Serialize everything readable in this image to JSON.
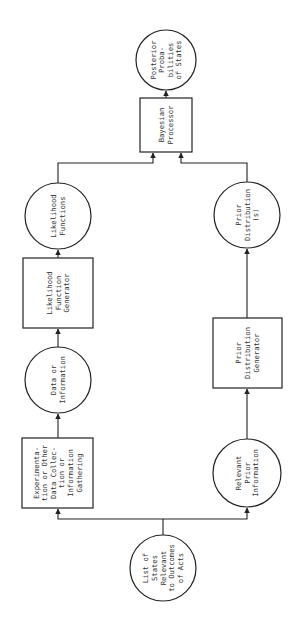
{
  "diagram": {
    "orientation": "rotated-90-ccw",
    "nodes": [
      {
        "id": "list_states",
        "shape": "circle",
        "lines": [
          "List of",
          "States",
          "Relevant",
          "to Outcomes",
          "of Acts"
        ]
      },
      {
        "id": "experimentation",
        "shape": "box",
        "lines": [
          "Experimenta-",
          "tion or Other",
          "Data Collec-",
          "tion or",
          "Information",
          "Gathering"
        ]
      },
      {
        "id": "data_info",
        "shape": "circle",
        "lines": [
          "Data or",
          "Information"
        ]
      },
      {
        "id": "likelihood_gen",
        "shape": "box",
        "lines": [
          "Likelihood",
          "Function",
          "Generator"
        ]
      },
      {
        "id": "likelihood_funcs",
        "shape": "circle",
        "lines": [
          "Likelihood",
          "Functions"
        ]
      },
      {
        "id": "relevant_prior",
        "shape": "circle",
        "lines": [
          "Relevant",
          "Prior",
          "Information"
        ]
      },
      {
        "id": "prior_gen",
        "shape": "box",
        "lines": [
          "Prior",
          "Distribution",
          "Generator"
        ]
      },
      {
        "id": "prior_dist",
        "shape": "circle",
        "lines": [
          "Prior",
          "Distribution",
          "(s)"
        ]
      },
      {
        "id": "bayesian",
        "shape": "box",
        "lines": [
          "Bayesian",
          "Processor"
        ]
      },
      {
        "id": "posterior",
        "shape": "circle",
        "lines": [
          "Posterior",
          "Proba-",
          "bilities",
          "of States"
        ]
      }
    ],
    "edges": [
      {
        "from": "list_states",
        "to": "experimentation"
      },
      {
        "from": "list_states",
        "to": "relevant_prior"
      },
      {
        "from": "experimentation",
        "to": "data_info"
      },
      {
        "from": "data_info",
        "to": "likelihood_gen"
      },
      {
        "from": "likelihood_gen",
        "to": "likelihood_funcs"
      },
      {
        "from": "likelihood_funcs",
        "to": "bayesian"
      },
      {
        "from": "relevant_prior",
        "to": "prior_gen"
      },
      {
        "from": "prior_gen",
        "to": "prior_dist"
      },
      {
        "from": "prior_dist",
        "to": "bayesian"
      },
      {
        "from": "bayesian",
        "to": "posterior"
      }
    ],
    "colors": {
      "stroke": "#222222",
      "text": "#333333",
      "background": "#ffffff"
    }
  }
}
